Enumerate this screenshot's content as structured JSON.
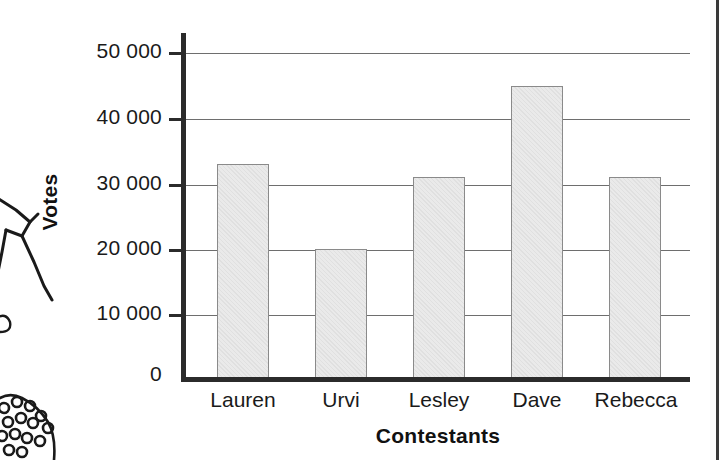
{
  "page": {
    "background_color": "#ffffff",
    "edge_rule_color": "#3a3a3a",
    "decoration": {
      "name": "cut-off-line-art-illustration",
      "description": "partial black-and-white line drawing of a person at the left margin"
    }
  },
  "chart_data": {
    "type": "bar",
    "title": "",
    "subtitle": "",
    "xlabel": "Contestants",
    "ylabel": "Votes",
    "categories": [
      "Lauren",
      "Urvi",
      "Lesley",
      "Dave",
      "Rebecca"
    ],
    "values": [
      33000,
      20000,
      31000,
      45000,
      31000
    ],
    "ylim": [
      0,
      52000
    ],
    "yticks": [
      0,
      10000,
      20000,
      30000,
      40000,
      50000
    ],
    "ytick_labels": [
      "0",
      "10 000",
      "20 000",
      "30 000",
      "40 000",
      "50 000"
    ],
    "grid": true,
    "grid_axis": "y",
    "legend": null,
    "legend_position": "none",
    "bar_fill_color": "#eaeaea",
    "bar_edge_color": "#8a8a8a",
    "axis_color": "#2b2b2b",
    "gridline_color": "#6e6e6e"
  }
}
